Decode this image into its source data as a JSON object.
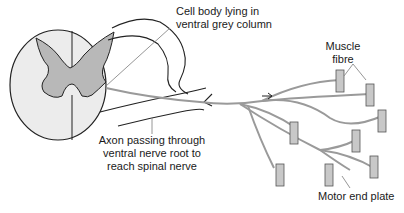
{
  "diagram": {
    "labels": {
      "cell_body_line1": "Cell body lying in",
      "cell_body_line2": "ventral grey column",
      "axon_line1": "Axon passing through",
      "axon_line2": "ventral nerve root to",
      "axon_line3": "reach spinal nerve",
      "muscle_line1": "Muscle",
      "muscle_line2": "fibre",
      "motor_end_plate": "Motor end plate"
    },
    "colors": {
      "outline": "#222222",
      "grey_matter": "#b8b8b8",
      "white_matter": "#ececec",
      "axon": "#9a9a9a",
      "muscle_fibre": "#c8c8c8",
      "pointer": "#8a8a8a"
    }
  }
}
